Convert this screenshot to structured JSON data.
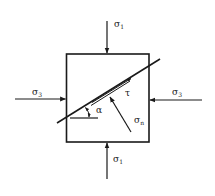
{
  "diagram": {
    "type": "stress-element",
    "labels": {
      "top_stress": "σ",
      "top_stress_sub": "1",
      "bottom_stress": "σ",
      "bottom_stress_sub": "1",
      "left_stress": "σ",
      "left_stress_sub": "3",
      "right_stress": "σ",
      "right_stress_sub": "3",
      "shear_stress": "τ",
      "normal_stress": "σ",
      "normal_stress_sub": "n",
      "angle": "α"
    },
    "colors": {
      "stroke": "#1a1a1a",
      "background": "#ffffff"
    }
  }
}
